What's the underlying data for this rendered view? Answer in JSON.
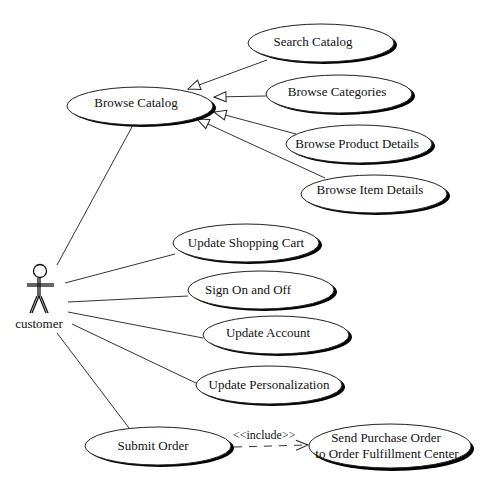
{
  "diagram": {
    "type": "uml-use-case",
    "actor": {
      "id": "customer",
      "label": "customer"
    },
    "use_cases": [
      {
        "id": "browse-catalog",
        "label": "Browse Catalog"
      },
      {
        "id": "search-catalog",
        "label": "Search Catalog"
      },
      {
        "id": "browse-categories",
        "label": "Browse Categories"
      },
      {
        "id": "browse-product-details",
        "label": "Browse Product Details"
      },
      {
        "id": "browse-item-details",
        "label": "Browse Item Details"
      },
      {
        "id": "update-shopping-cart",
        "label": "Update Shopping Cart"
      },
      {
        "id": "sign-on-and-off",
        "label": "Sign On and Off"
      },
      {
        "id": "update-account",
        "label": "Update Account"
      },
      {
        "id": "update-personalization",
        "label": "Update Personalization"
      },
      {
        "id": "submit-order",
        "label": "Submit Order"
      },
      {
        "id": "send-purchase-order",
        "label_line1": "Send Purchase Order",
        "label_line2": "to Order Fulfillment Center"
      }
    ],
    "relationships": {
      "include_label": "<<include>>",
      "associations": [
        [
          "customer",
          "browse-catalog"
        ],
        [
          "customer",
          "update-shopping-cart"
        ],
        [
          "customer",
          "sign-on-and-off"
        ],
        [
          "customer",
          "update-account"
        ],
        [
          "customer",
          "update-personalization"
        ],
        [
          "customer",
          "submit-order"
        ]
      ],
      "generalizations": [
        [
          "search-catalog",
          "browse-catalog"
        ],
        [
          "browse-categories",
          "browse-catalog"
        ],
        [
          "browse-product-details",
          "browse-catalog"
        ],
        [
          "browse-item-details",
          "browse-catalog"
        ]
      ],
      "includes": [
        [
          "submit-order",
          "send-purchase-order"
        ]
      ]
    }
  }
}
